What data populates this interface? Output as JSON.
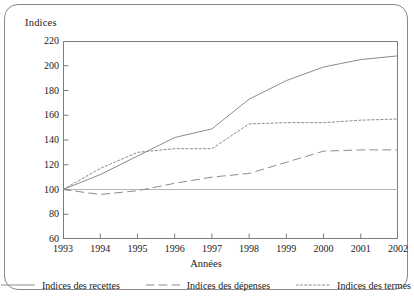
{
  "axis_title": "Indices",
  "xlabel": "Années",
  "legend": [
    {
      "label": "Indices des recettes",
      "style": "solid",
      "key": "recettes"
    },
    {
      "label": "Indices des dépenses",
      "style": "dashed",
      "key": "depenses"
    },
    {
      "label": "Indices des termes",
      "style": "dotted",
      "key": "termes"
    }
  ],
  "colors": {
    "axis": "#7d7d7d",
    "frame": "#8a8a8a",
    "line": "#8c8c8c",
    "text": "#1a1a1a",
    "baseline": "#b5b5b5"
  },
  "chart_data": {
    "type": "line",
    "title": "",
    "xlabel": "Années",
    "ylabel": "Indices",
    "x": [
      1993,
      1994,
      1995,
      1996,
      1997,
      1998,
      1999,
      2000,
      2001,
      2002
    ],
    "xtick_labels": [
      "1993",
      "1994",
      "1995",
      "1996",
      "1997",
      "1998",
      "1999",
      "2000",
      "2001",
      "2002"
    ],
    "ytick_labels": [
      "220",
      "200",
      "180",
      "160",
      "140",
      "120",
      "100",
      "80",
      "60"
    ],
    "yticks": [
      220,
      200,
      180,
      160,
      140,
      120,
      100,
      80,
      60
    ],
    "ylim": [
      60,
      220
    ],
    "xlim": [
      1993,
      2002
    ],
    "grid": false,
    "legend_position": "bottom",
    "baseline": 100,
    "series": [
      {
        "name": "Indices des recettes",
        "style": "solid",
        "values": [
          100,
          112,
          127,
          142,
          149,
          173,
          188,
          199,
          205,
          208
        ]
      },
      {
        "name": "Indices des dépenses",
        "style": "dashed",
        "values": [
          100,
          96,
          99,
          105,
          110,
          113,
          122,
          131,
          132,
          132
        ]
      },
      {
        "name": "Indices des termes",
        "style": "dotted",
        "values": [
          100,
          117,
          130,
          133,
          133,
          153,
          154,
          154,
          156,
          157
        ]
      }
    ]
  }
}
